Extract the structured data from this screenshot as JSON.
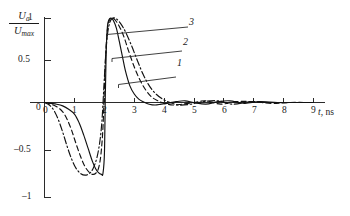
{
  "figure": {
    "background_color": "#ffffff",
    "ink_color": "#111111"
  },
  "axes": {
    "y_title_numerator": "U",
    "y_title_numerator_sub": "a",
    "y_title_denominator": "U",
    "y_title_denominator_sub": "max",
    "x_title_symbol": "t",
    "x_title_unit": ", ns",
    "y_ticks": [
      "1",
      "0.5",
      "0",
      "–0.5",
      "–1"
    ],
    "x_ticks": [
      "0",
      "1",
      "2",
      "3",
      "4",
      "5",
      "6",
      "7",
      "8",
      "9"
    ]
  },
  "curve_labels": [
    {
      "text": "1"
    },
    {
      "text": "2"
    },
    {
      "text": "3"
    }
  ],
  "chart_data": {
    "type": "line",
    "title": "",
    "xlabel": "t, ns",
    "ylabel": "Ua / Umax",
    "xlim": [
      0,
      9
    ],
    "ylim": [
      -1,
      1
    ],
    "grid": false,
    "legend": "inline-curve-numbers",
    "x_tick_values": [
      0,
      1,
      2,
      3,
      4,
      5,
      6,
      7,
      8,
      9
    ],
    "y_tick_values": [
      -1,
      -0.5,
      0,
      0.5,
      1
    ],
    "series": [
      {
        "name": "1",
        "line_style": "solid",
        "label_position": {
          "x": 5.2,
          "y": 0.52
        },
        "x": [
          0.0,
          0.2,
          0.4,
          0.6,
          0.8,
          1.0,
          1.15,
          1.3,
          1.45,
          1.6,
          1.7,
          1.8,
          1.9,
          1.95,
          2.0,
          2.03,
          2.06,
          2.1,
          2.15,
          2.22,
          2.3,
          2.4,
          2.5,
          2.6,
          2.7,
          2.85,
          3.0,
          3.15,
          3.3,
          3.5,
          3.7,
          3.9,
          4.1,
          4.4,
          4.7,
          5.0,
          5.4,
          5.8,
          6.2,
          6.7,
          7.2,
          7.8,
          8.4,
          9.0
        ],
        "y": [
          0.0,
          -0.01,
          -0.02,
          -0.04,
          -0.08,
          -0.14,
          -0.24,
          -0.38,
          -0.54,
          -0.7,
          -0.78,
          -0.83,
          -0.85,
          -0.84,
          -0.6,
          0.1,
          0.62,
          0.9,
          0.98,
          1.0,
          0.97,
          0.88,
          0.72,
          0.55,
          0.38,
          0.2,
          0.1,
          0.04,
          0.01,
          -0.02,
          -0.03,
          -0.02,
          -0.01,
          0.01,
          0.02,
          0.0,
          -0.02,
          0.01,
          0.02,
          -0.01,
          0.01,
          0.0,
          0.0,
          0.0
        ]
      },
      {
        "name": "2",
        "line_style": "dashed",
        "label_position": {
          "x": 5.45,
          "y": 0.76
        },
        "x": [
          0.0,
          0.2,
          0.4,
          0.6,
          0.75,
          0.9,
          1.05,
          1.2,
          1.35,
          1.5,
          1.6,
          1.7,
          1.8,
          1.88,
          1.95,
          2.0,
          2.05,
          2.1,
          2.16,
          2.25,
          2.35,
          2.5,
          2.65,
          2.8,
          3.0,
          3.2,
          3.4,
          3.6,
          3.8,
          4.0,
          4.3,
          4.6,
          5.0,
          5.4,
          5.9,
          6.4,
          7.0,
          7.6,
          8.2,
          9.0
        ],
        "y": [
          0.0,
          -0.02,
          -0.05,
          -0.11,
          -0.2,
          -0.33,
          -0.49,
          -0.64,
          -0.76,
          -0.83,
          -0.85,
          -0.84,
          -0.78,
          -0.62,
          -0.3,
          0.18,
          0.62,
          0.86,
          0.97,
          1.0,
          0.98,
          0.9,
          0.78,
          0.62,
          0.42,
          0.26,
          0.14,
          0.06,
          0.02,
          -0.01,
          -0.03,
          -0.02,
          0.0,
          0.02,
          -0.02,
          0.01,
          0.01,
          -0.01,
          0.0,
          0.0
        ]
      },
      {
        "name": "3",
        "line_style": "dash-dot",
        "label_position": {
          "x": 5.6,
          "y": 0.97
        },
        "x": [
          0.0,
          0.15,
          0.3,
          0.45,
          0.6,
          0.75,
          0.9,
          1.05,
          1.2,
          1.35,
          1.5,
          1.62,
          1.75,
          1.85,
          1.92,
          1.98,
          2.04,
          2.1,
          2.18,
          2.28,
          2.4,
          2.55,
          2.7,
          2.9,
          3.1,
          3.3,
          3.5,
          3.7,
          3.95,
          4.2,
          4.5,
          4.9,
          5.3,
          5.8,
          6.3,
          6.9,
          7.5,
          8.2,
          9.0
        ],
        "y": [
          0.0,
          -0.03,
          -0.09,
          -0.2,
          -0.35,
          -0.52,
          -0.67,
          -0.78,
          -0.84,
          -0.86,
          -0.84,
          -0.78,
          -0.65,
          -0.45,
          -0.2,
          0.18,
          0.55,
          0.8,
          0.95,
          1.0,
          0.99,
          0.93,
          0.84,
          0.68,
          0.5,
          0.33,
          0.2,
          0.11,
          0.04,
          0.0,
          -0.03,
          -0.02,
          0.01,
          0.02,
          -0.02,
          0.01,
          0.0,
          0.0,
          0.0
        ]
      }
    ]
  }
}
